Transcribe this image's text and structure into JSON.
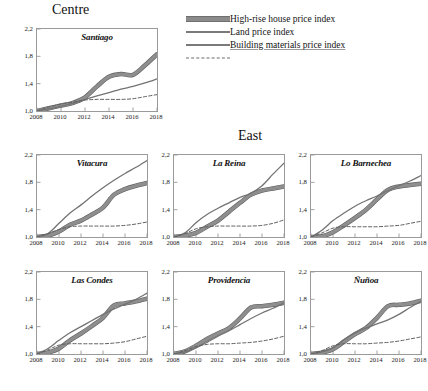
{
  "sections": [
    {
      "id": "centre",
      "label": "Centre"
    },
    {
      "id": "east",
      "label": "East"
    }
  ],
  "legend": {
    "items": [
      {
        "key": "highrise",
        "label": "High-rise house price index",
        "style": "thick-gray-band",
        "color": "#8b8b8b"
      },
      {
        "key": "land",
        "label": "Land price index",
        "style": "solid",
        "color": "#7a7a7a"
      },
      {
        "key": "building",
        "label": "Building materials price index",
        "style": "dashed",
        "color": "#6a6a6a",
        "spellcheck_underline": true
      }
    ]
  },
  "axes": {
    "yticks": [
      "2,2",
      "1,8",
      "1,4",
      "1,0"
    ],
    "yvalues": [
      2.2,
      1.8,
      1.4,
      1.0
    ],
    "ylim": [
      1.0,
      2.2
    ],
    "xticks": [
      "2008",
      "2010",
      "2012",
      "2014",
      "2016",
      "2018"
    ],
    "xvalues": [
      2008,
      2010,
      2012,
      2014,
      2016,
      2018
    ],
    "xlim": [
      2008,
      2018
    ]
  },
  "chart_data": {
    "type": "line",
    "xlabel": "",
    "ylabel": "",
    "xlim": [
      2008,
      2018
    ],
    "ylim": [
      1.0,
      2.2
    ],
    "grid": false,
    "legend_position": "top-right",
    "x": [
      2008,
      2009,
      2010,
      2011,
      2012,
      2013,
      2014,
      2015,
      2016,
      2017,
      2018
    ],
    "series_names": [
      "High-rise house price index",
      "Land price index",
      "Building materials price index"
    ],
    "panels": [
      {
        "name": "Santiago",
        "section": "Centre",
        "series": [
          {
            "name": "High-rise house price index",
            "values": [
              1.0,
              1.04,
              1.08,
              1.12,
              1.2,
              1.36,
              1.5,
              1.54,
              1.53,
              1.67,
              1.83
            ]
          },
          {
            "name": "Land price index",
            "values": [
              1.0,
              1.03,
              1.07,
              1.11,
              1.17,
              1.22,
              1.27,
              1.32,
              1.36,
              1.41,
              1.47
            ]
          },
          {
            "name": "Building materials price index",
            "values": [
              1.0,
              1.06,
              1.1,
              1.13,
              1.16,
              1.17,
              1.17,
              1.17,
              1.18,
              1.21,
              1.24
            ]
          }
        ]
      },
      {
        "name": "Vitacura",
        "section": "East",
        "series": [
          {
            "name": "High-rise house price index",
            "values": [
              1.0,
              1.02,
              1.08,
              1.18,
              1.24,
              1.33,
              1.43,
              1.62,
              1.7,
              1.75,
              1.79
            ]
          },
          {
            "name": "Land price index",
            "values": [
              1.0,
              1.05,
              1.2,
              1.35,
              1.47,
              1.6,
              1.72,
              1.83,
              1.93,
              2.02,
              2.12
            ]
          },
          {
            "name": "Building materials price index",
            "values": [
              1.0,
              1.05,
              1.11,
              1.15,
              1.16,
              1.16,
              1.16,
              1.16,
              1.17,
              1.19,
              1.22
            ]
          }
        ]
      },
      {
        "name": "La Reina",
        "section": "East",
        "series": [
          {
            "name": "High-rise house price index",
            "values": [
              1.0,
              1.02,
              1.06,
              1.15,
              1.24,
              1.37,
              1.5,
              1.62,
              1.68,
              1.71,
              1.74
            ]
          },
          {
            "name": "Land price index",
            "values": [
              1.0,
              1.06,
              1.21,
              1.33,
              1.42,
              1.5,
              1.58,
              1.64,
              1.75,
              1.92,
              2.08
            ]
          },
          {
            "name": "Building materials price index",
            "values": [
              1.0,
              1.05,
              1.12,
              1.15,
              1.16,
              1.16,
              1.16,
              1.16,
              1.17,
              1.2,
              1.25
            ]
          }
        ]
      },
      {
        "name": "Lo Barnechea",
        "section": "East",
        "series": [
          {
            "name": "High-rise house price index",
            "values": [
              1.0,
              1.01,
              1.07,
              1.17,
              1.28,
              1.4,
              1.55,
              1.69,
              1.74,
              1.76,
              1.78
            ]
          },
          {
            "name": "Land price index",
            "values": [
              1.0,
              1.1,
              1.24,
              1.35,
              1.45,
              1.53,
              1.6,
              1.68,
              1.75,
              1.82,
              1.9
            ]
          },
          {
            "name": "Building materials price index",
            "values": [
              1.0,
              1.06,
              1.13,
              1.15,
              1.15,
              1.15,
              1.15,
              1.16,
              1.17,
              1.2,
              1.23
            ]
          }
        ]
      },
      {
        "name": "Las Condes",
        "section": "East",
        "series": [
          {
            "name": "High-rise house price index",
            "values": [
              1.0,
              1.02,
              1.08,
              1.2,
              1.3,
              1.41,
              1.53,
              1.71,
              1.74,
              1.77,
              1.81
            ]
          },
          {
            "name": "Land price index",
            "values": [
              1.0,
              1.08,
              1.2,
              1.31,
              1.4,
              1.49,
              1.58,
              1.66,
              1.73,
              1.8,
              1.89
            ]
          },
          {
            "name": "Building materials price index",
            "values": [
              1.0,
              1.06,
              1.13,
              1.15,
              1.15,
              1.15,
              1.15,
              1.16,
              1.18,
              1.22,
              1.26
            ]
          }
        ]
      },
      {
        "name": "Providencia",
        "section": "East",
        "series": [
          {
            "name": "High-rise house price index",
            "values": [
              1.0,
              1.04,
              1.12,
              1.22,
              1.3,
              1.38,
              1.52,
              1.68,
              1.7,
              1.72,
              1.75
            ]
          },
          {
            "name": "Land price index",
            "values": [
              1.0,
              1.03,
              1.09,
              1.17,
              1.26,
              1.34,
              1.43,
              1.52,
              1.6,
              1.67,
              1.75
            ]
          },
          {
            "name": "Building materials price index",
            "values": [
              1.0,
              1.05,
              1.11,
              1.14,
              1.15,
              1.15,
              1.16,
              1.17,
              1.19,
              1.22,
              1.26
            ]
          }
        ]
      },
      {
        "name": "Ñuñoa",
        "section": "East",
        "series": [
          {
            "name": "High-rise house price index",
            "values": [
              1.0,
              1.02,
              1.07,
              1.18,
              1.29,
              1.38,
              1.53,
              1.7,
              1.72,
              1.74,
              1.78
            ]
          },
          {
            "name": "Land price index",
            "values": [
              1.0,
              1.03,
              1.09,
              1.21,
              1.31,
              1.38,
              1.44,
              1.5,
              1.58,
              1.68,
              1.77
            ]
          },
          {
            "name": "Building materials price index",
            "values": [
              1.0,
              1.05,
              1.12,
              1.15,
              1.15,
              1.15,
              1.16,
              1.17,
              1.19,
              1.22,
              1.25
            ]
          }
        ]
      }
    ]
  },
  "layout": {
    "panel_positions": [
      {
        "panel": "Santiago",
        "left": 10,
        "top": 18,
        "w": 150,
        "h": 112
      },
      {
        "panel": "Vitacura",
        "left": 10,
        "top": 144,
        "w": 140,
        "h": 112
      },
      {
        "panel": "La Reina",
        "left": 147,
        "top": 144,
        "w": 140,
        "h": 112
      },
      {
        "panel": "Lo Barnechea",
        "left": 284,
        "top": 144,
        "w": 140,
        "h": 112
      },
      {
        "panel": "Las Condes",
        "left": 10,
        "top": 261,
        "w": 140,
        "h": 112
      },
      {
        "panel": "Providencia",
        "left": 147,
        "top": 261,
        "w": 140,
        "h": 112
      },
      {
        "panel": "Ñuñoa",
        "left": 284,
        "top": 261,
        "w": 140,
        "h": 112
      }
    ]
  }
}
